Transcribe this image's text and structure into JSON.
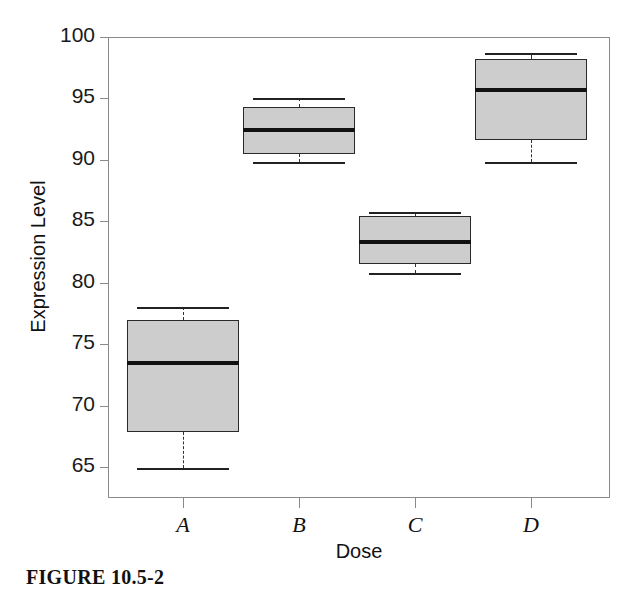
{
  "figure": {
    "caption": "FIGURE 10.5-2"
  },
  "chart_data": {
    "type": "box",
    "title": "",
    "xlabel": "Dose",
    "ylabel": "Expression Level",
    "categories": [
      "A",
      "B",
      "C",
      "D"
    ],
    "ylim": [
      62.5,
      100
    ],
    "yticks": [
      65,
      70,
      75,
      80,
      85,
      90,
      95,
      100
    ],
    "ytick_labels": [
      "65",
      "70",
      "75",
      "80",
      "85",
      "90",
      "95",
      "100"
    ],
    "grid": false,
    "legend": "none",
    "box_fill_color": "#cdcdcd",
    "box_edge_color": "#2a2a2a",
    "median_color": "#111111",
    "whisker_style": "dashed",
    "axis_color": "#8a8a8a",
    "boxes": [
      {
        "category": "A",
        "whisker_low": 64.9,
        "q1": 67.9,
        "median": 73.5,
        "q3": 77.0,
        "whisker_high": 78.0
      },
      {
        "category": "B",
        "whisker_low": 89.8,
        "q1": 90.5,
        "median": 92.4,
        "q3": 94.3,
        "whisker_high": 95.0
      },
      {
        "category": "C",
        "whisker_low": 80.8,
        "q1": 81.5,
        "median": 83.3,
        "q3": 85.4,
        "whisker_high": 85.8
      },
      {
        "category": "D",
        "whisker_low": 89.8,
        "q1": 91.6,
        "median": 95.7,
        "q3": 98.2,
        "whisker_high": 98.7
      }
    ]
  }
}
